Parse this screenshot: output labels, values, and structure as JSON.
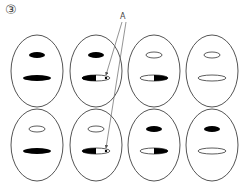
{
  "figure": {
    "number_label": "③",
    "annotation_label": "A",
    "colors": {
      "stroke": "#555555",
      "fill": "#000000",
      "background": "#ffffff"
    },
    "grid": {
      "rows": 2,
      "cols": 4,
      "cells": [
        {
          "row": 1,
          "col": 1,
          "upper": "filled",
          "lower": "filled"
        },
        {
          "row": 1,
          "col": 2,
          "upper": "filled",
          "lower": "filled-left-open-right-with-dot",
          "arrow_target": true
        },
        {
          "row": 1,
          "col": 3,
          "upper": "open",
          "lower": "open-left-filled-right"
        },
        {
          "row": 1,
          "col": 4,
          "upper": "open",
          "lower": "open"
        },
        {
          "row": 2,
          "col": 1,
          "upper": "open",
          "lower": "filled"
        },
        {
          "row": 2,
          "col": 2,
          "upper": "open",
          "lower": "filled-left-open-right-with-dot",
          "arrow_target": true
        },
        {
          "row": 2,
          "col": 3,
          "upper": "filled",
          "lower": "open-left-filled-right"
        },
        {
          "row": 2,
          "col": 4,
          "upper": "filled",
          "lower": "open"
        }
      ]
    }
  }
}
